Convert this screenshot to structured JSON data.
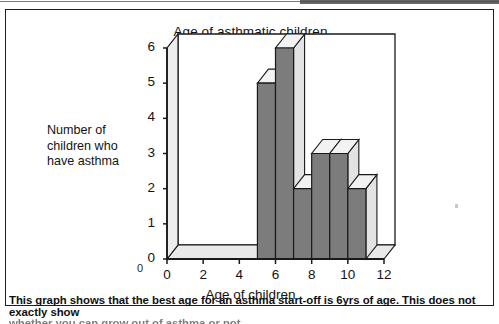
{
  "document": {
    "caption_line_1": "This graph shows that the best age for an asthma start-off is 6yrs of age. This does not exactly show",
    "caption_line_2": "whether you can grow out of asthma or not."
  },
  "chart_data": {
    "type": "bar",
    "title": "Age of asthmatic children",
    "xlabel": "Age of children",
    "ylabel": "Number of children who have asthma",
    "ylabel_lines": [
      "Number of",
      "children who",
      "have asthma"
    ],
    "categories": [
      5,
      6,
      7,
      8,
      9,
      10
    ],
    "values": [
      5,
      6,
      2,
      3,
      3,
      2
    ],
    "x_ticks": [
      "0",
      "2",
      "4",
      "6",
      "8",
      "10",
      "12"
    ],
    "x_tick_values": [
      0,
      2,
      4,
      6,
      8,
      10,
      12
    ],
    "y_ticks": [
      "0",
      "1",
      "2",
      "3",
      "4",
      "5",
      "6"
    ],
    "y_tick_values": [
      0,
      1,
      2,
      3,
      4,
      5,
      6
    ],
    "xlim": [
      0,
      12
    ],
    "ylim": [
      0,
      6
    ],
    "grid": false,
    "legend": null,
    "style": "3d-column",
    "bar_face_color": "#7c7c7c",
    "bar_top_color": "#f2f2f2",
    "bar_side_color": "#e3e3e3",
    "axis_color": "#1a1a1a",
    "wall_color": "#ffffff",
    "floor_color": "#e9e9e9",
    "corner_zero": "0"
  }
}
